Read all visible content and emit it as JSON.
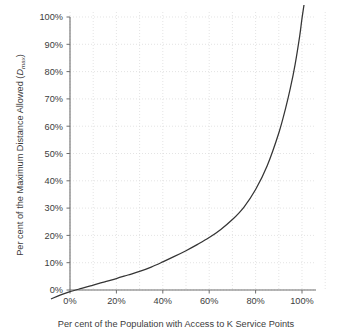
{
  "chart_data": {
    "type": "line",
    "title": "",
    "subtitle": "",
    "xlabel": "Per cent of the Population with Access to K Service Points",
    "ylabel_prefix": "Per cent of the Maximum Distance Allowed (",
    "ylabel_symbol": "D",
    "ylabel_subscript": "max",
    "ylabel_suffix": ")",
    "ylabel_full": "Per cent of the Maximum Distance Allowed (Dmax)",
    "xlim": [
      0,
      100
    ],
    "ylim": [
      0,
      100
    ],
    "grid": true,
    "legend": "none",
    "x_tick_labels": [
      "0%",
      "20%",
      "40%",
      "60%",
      "80%",
      "100%"
    ],
    "x_tick_values": [
      0,
      20,
      40,
      60,
      80,
      100
    ],
    "y_tick_labels": [
      "0%",
      "10%",
      "20%",
      "30%",
      "40%",
      "50%",
      "60%",
      "70%",
      "80%",
      "90%",
      "100%"
    ],
    "y_tick_values": [
      0,
      10,
      20,
      30,
      40,
      50,
      60,
      70,
      80,
      90,
      100
    ],
    "x_minor_gridlines": [
      10,
      30,
      50,
      70,
      90
    ],
    "series": [
      {
        "name": "Dmax vs population access",
        "color": "#353535",
        "x": [
          -8,
          -4,
          0,
          5,
          8,
          10,
          15,
          20,
          25,
          30,
          35,
          40,
          45,
          50,
          55,
          60,
          65,
          70,
          75,
          80,
          85,
          90,
          93,
          95,
          97,
          99,
          100,
          101.5
        ],
        "y": [
          -3.2,
          -1.8,
          -0.6,
          0.6,
          1.3,
          1.8,
          3.0,
          4.2,
          5.5,
          6.8,
          8.4,
          10.3,
          12.3,
          14.4,
          16.7,
          19.2,
          22.2,
          25.8,
          30.4,
          36.8,
          45.5,
          57.5,
          66.8,
          74.0,
          82.5,
          93.0,
          99.5,
          108.0
        ]
      }
    ],
    "axis_color": "#6e6e6e",
    "grid_color": "#d8d8d8",
    "text_color": "#3c3c3c",
    "background": "#ffffff"
  },
  "figure": {
    "width": 347,
    "height": 334
  }
}
